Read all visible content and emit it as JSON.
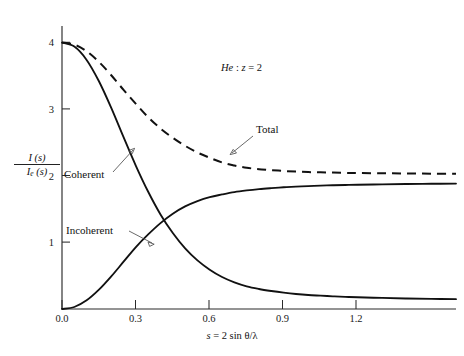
{
  "figure": {
    "background": "#ffffff",
    "ink_color": "#111111"
  },
  "chart_data": {
    "type": "line",
    "title": "",
    "annotation": "He: z = 2",
    "annotation_parts": {
      "element": "He",
      "separator": " : ",
      "variable": "z",
      "equals": " = ",
      "value": "2"
    },
    "xlabel": "s = 2 sin θ/λ",
    "xlabel_parts": {
      "lhs": "s",
      "eq": " = ",
      "rhs": "2 sin θ/λ"
    },
    "ylabel": "I (s) / I_e (s)",
    "ylabel_parts": {
      "numerator": "I (s)",
      "denominator_main": "I",
      "denominator_sub": "e",
      "denominator_rest": " (s)"
    },
    "xlim": [
      0.0,
      1.6
    ],
    "ylim": [
      0.0,
      4.35
    ],
    "xticks": [
      0.0,
      0.3,
      0.6,
      0.9,
      1.2
    ],
    "xticklabels": [
      "0.0",
      "0.3",
      "0.6",
      "0.9",
      "1.2"
    ],
    "yticks": [
      1,
      2,
      3,
      4
    ],
    "yticklabels": [
      "1",
      "2",
      "3",
      "4"
    ],
    "grid": false,
    "legend_position": "inline-annotations",
    "x": [
      0.0,
      0.05,
      0.1,
      0.15,
      0.2,
      0.25,
      0.3,
      0.35,
      0.4,
      0.45,
      0.5,
      0.55,
      0.6,
      0.65,
      0.7,
      0.75,
      0.8,
      0.85,
      0.9,
      0.95,
      1.0,
      1.05,
      1.1,
      1.15,
      1.2,
      1.3,
      1.4,
      1.5,
      1.6
    ],
    "series": [
      {
        "name": "Coherent",
        "style": "solid",
        "values": [
          4.0,
          3.94,
          3.74,
          3.42,
          3.02,
          2.58,
          2.15,
          1.76,
          1.42,
          1.14,
          0.91,
          0.73,
          0.59,
          0.48,
          0.4,
          0.34,
          0.3,
          0.27,
          0.245,
          0.225,
          0.21,
          0.2,
          0.19,
          0.182,
          0.176,
          0.166,
          0.158,
          0.152,
          0.148
        ]
      },
      {
        "name": "Incoherent",
        "style": "solid",
        "values": [
          0.0,
          0.03,
          0.13,
          0.29,
          0.49,
          0.71,
          0.93,
          1.12,
          1.29,
          1.43,
          1.54,
          1.62,
          1.68,
          1.72,
          1.755,
          1.78,
          1.8,
          1.815,
          1.828,
          1.838,
          1.846,
          1.853,
          1.858,
          1.862,
          1.866,
          1.872,
          1.877,
          1.88,
          1.883
        ]
      },
      {
        "name": "Total",
        "style": "dashed",
        "values": [
          4.0,
          3.97,
          3.87,
          3.71,
          3.51,
          3.29,
          3.08,
          2.88,
          2.71,
          2.57,
          2.45,
          2.35,
          2.27,
          2.2,
          2.155,
          2.12,
          2.1,
          2.085,
          2.073,
          2.063,
          2.056,
          2.053,
          2.048,
          2.044,
          2.042,
          2.038,
          2.035,
          2.032,
          2.031
        ]
      }
    ],
    "annotations": [
      {
        "label": "Coherent",
        "target_series": "Coherent",
        "arrow": "up-right"
      },
      {
        "label": "Incoherent",
        "target_series": "Incoherent",
        "arrow": "down-right"
      },
      {
        "label": "Total",
        "target_series": "Total",
        "arrow": "down-left"
      }
    ]
  }
}
